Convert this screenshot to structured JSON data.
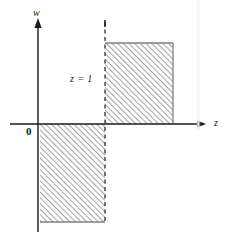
{
  "figure": {
    "background_color": "#ffffff",
    "ink_color": "#1a1a1a",
    "hatch_color": "#9a9a9a",
    "labels": {
      "vertical_axis": "w",
      "horizontal_axis": "z",
      "origin": "0",
      "dashed_line": "z = 1"
    },
    "axes": {
      "vertical": {
        "x": 38,
        "y_top": 20,
        "y_bottom": 232,
        "arrow": "up"
      },
      "horizontal": {
        "y": 124,
        "x_left": 10,
        "x_right": 206,
        "arrow": "right"
      }
    },
    "dashed_line": {
      "x": 105,
      "y_top": 22,
      "y_bottom": 222,
      "style": "dashed"
    },
    "regions": [
      {
        "name": "upper-right-region",
        "x": 105,
        "y": 43,
        "width": 68,
        "height": 81,
        "fill": "hatched-45",
        "quadrant": "upper-right"
      },
      {
        "name": "lower-left-region",
        "x": 40,
        "y": 124,
        "width": 65,
        "height": 98,
        "fill": "hatched-45",
        "quadrant": "lower-left"
      }
    ]
  }
}
